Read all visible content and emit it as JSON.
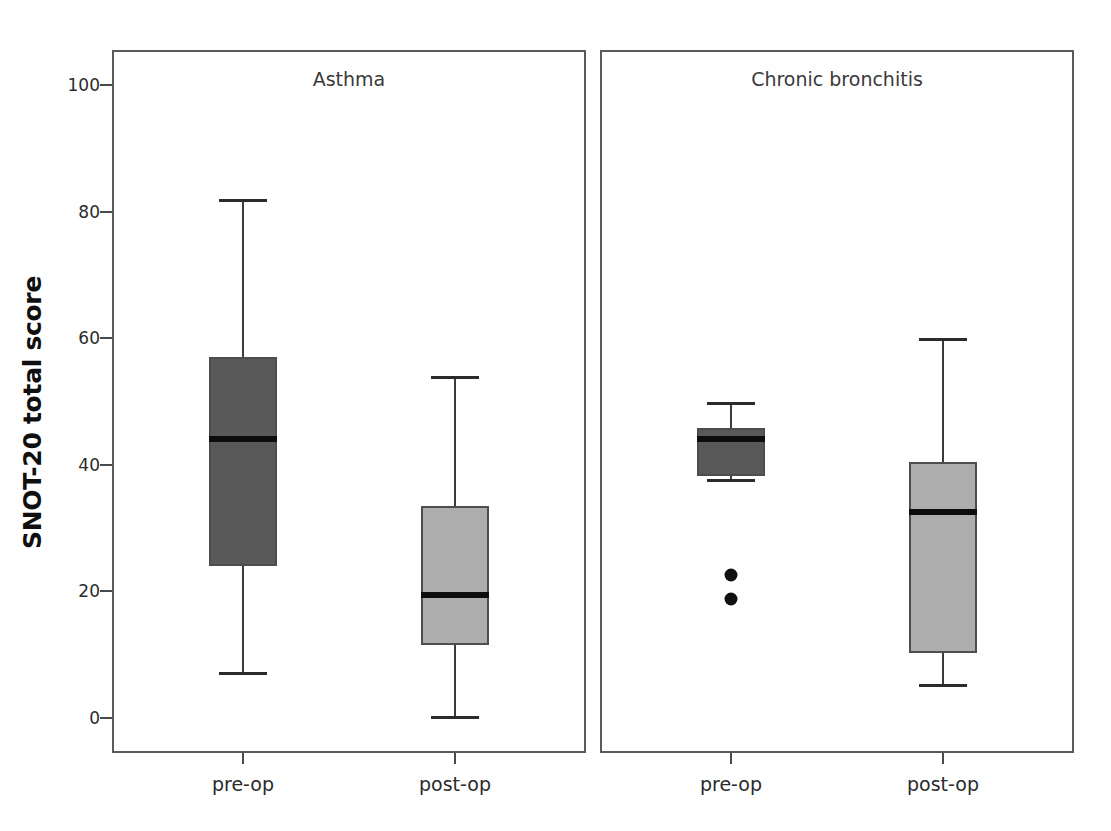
{
  "chart_data": {
    "type": "box",
    "title": "",
    "xlabel": "",
    "ylabel": "SNOT-20 total score",
    "ylim": [
      0,
      100
    ],
    "yticks": [
      0,
      20,
      40,
      60,
      80,
      100
    ],
    "ytick_labels": [
      "0",
      "20",
      "40",
      "60",
      "80",
      "100"
    ],
    "grid": false,
    "legend": "none",
    "panels": [
      {
        "title": "Asthma",
        "categories": [
          "pre-op",
          "post-op"
        ],
        "boxes": [
          {
            "category": "pre-op",
            "fill": "#595959",
            "whisker_low": 7,
            "q1": 24,
            "median": 44,
            "q3": 57,
            "whisker_high": 82,
            "outliers": []
          },
          {
            "category": "post-op",
            "fill": "#adadad",
            "whisker_low": 0,
            "q1": 11.5,
            "median": 19.5,
            "q3": 33.5,
            "whisker_high": 54,
            "outliers": []
          }
        ]
      },
      {
        "title": "Chronic bronchitis",
        "categories": [
          "pre-op",
          "post-op"
        ],
        "boxes": [
          {
            "category": "pre-op",
            "fill": "#595959",
            "whisker_low": 37.5,
            "q1": 38.3,
            "median": 44,
            "q3": 45.8,
            "whisker_high": 50,
            "outliers": [
              22.6,
              18.8
            ]
          },
          {
            "category": "post-op",
            "fill": "#adadad",
            "whisker_low": 5,
            "q1": 10.2,
            "median": 32.5,
            "q3": 40.5,
            "whisker_high": 60,
            "outliers": []
          }
        ]
      }
    ]
  },
  "axis": {
    "ylabel": "SNOT-20 total score",
    "ytick_0": "0",
    "ytick_20": "20",
    "ytick_40": "40",
    "ytick_60": "60",
    "ytick_80": "80",
    "ytick_100": "100"
  },
  "panel_left": {
    "title": "Asthma",
    "xtick_1": "pre-op",
    "xtick_2": "post-op"
  },
  "panel_right": {
    "title": "Chronic bronchitis",
    "xtick_1": "pre-op",
    "xtick_2": "post-op"
  },
  "colors": {
    "box_dark": "#595959",
    "box_light": "#adadad",
    "line": "#4d4d4d",
    "median": "#0d0d0d",
    "outlier": "#111111"
  }
}
